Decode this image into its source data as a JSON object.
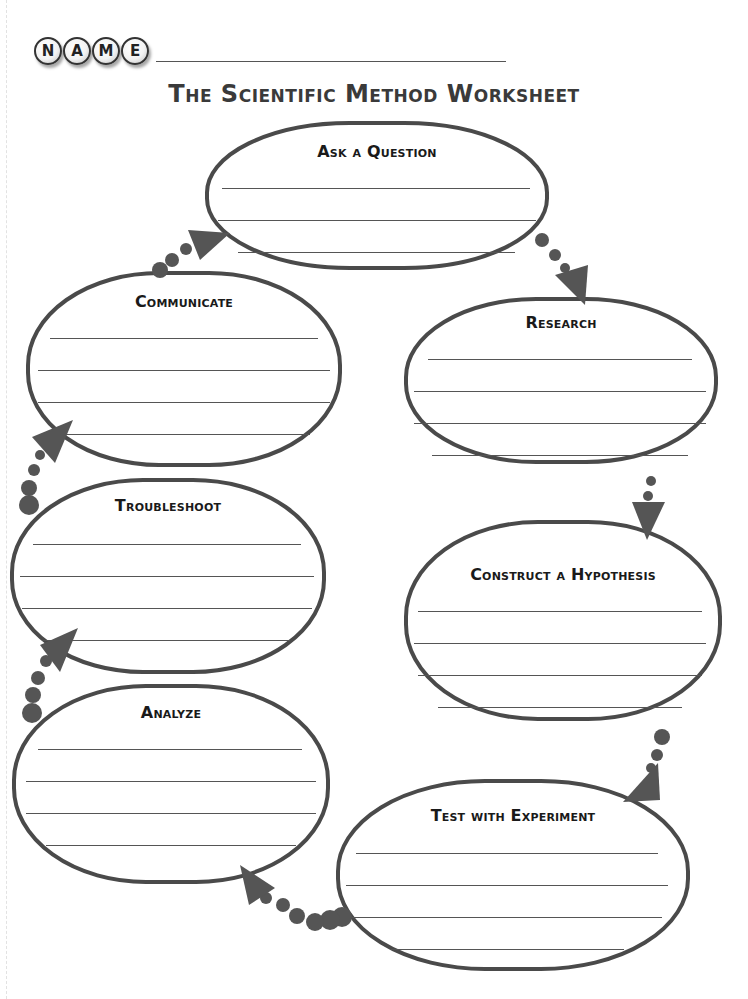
{
  "header": {
    "name_letters": [
      "N",
      "A",
      "M",
      "E"
    ],
    "name_field_value": "",
    "title": "The Scientific Method Worksheet"
  },
  "steps": [
    {
      "id": "ask-a-question",
      "label": "Ask a Question",
      "answer_lines": 3
    },
    {
      "id": "research",
      "label": "Research",
      "answer_lines": 4
    },
    {
      "id": "construct-a-hypothesis",
      "label": "Construct a Hypothesis",
      "answer_lines": 4
    },
    {
      "id": "test-with-experiment",
      "label": "Test with Experiment",
      "answer_lines": 4
    },
    {
      "id": "analyze",
      "label": "Analyze",
      "answer_lines": 4
    },
    {
      "id": "troubleshoot",
      "label": "Troubleshoot",
      "answer_lines": 4
    },
    {
      "id": "communicate",
      "label": "Communicate",
      "answer_lines": 4
    }
  ],
  "flow_order": [
    "ask-a-question",
    "research",
    "construct-a-hypothesis",
    "test-with-experiment",
    "analyze",
    "troubleshoot",
    "communicate",
    "ask-a-question"
  ],
  "colors": {
    "outline": "#4a4a4a",
    "arrow": "#555555",
    "rule_line": "#555555",
    "text": "#1a1a1a"
  }
}
